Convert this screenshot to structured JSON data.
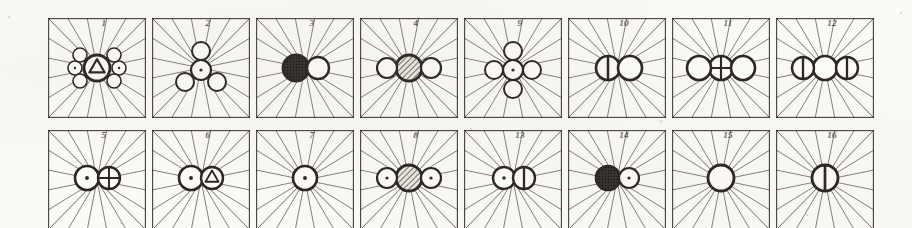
{
  "figure": {
    "kind": "crystallographic-plate",
    "background_color": "#fbfaf7",
    "ink_color": "#2a2724",
    "rows": 2,
    "columns": 8,
    "cell_width": 98,
    "cell_height": 100,
    "ray_count": 20,
    "caption": ""
  },
  "cells": [
    {
      "number": "1",
      "row": 0,
      "col": 0,
      "x": 48,
      "y": 18,
      "description": "central triangle-in-circle flanked by two dot-circles and four plain circles",
      "glyphs": [
        {
          "shape": "circle-triangle",
          "cx": 49,
          "cy": 50,
          "r": 13
        },
        {
          "shape": "circle-dot",
          "cx": 27,
          "cy": 50,
          "r": 7
        },
        {
          "shape": "circle-dot",
          "cx": 71,
          "cy": 50,
          "r": 7
        },
        {
          "shape": "circle-plain",
          "cx": 32,
          "cy": 37,
          "r": 7
        },
        {
          "shape": "circle-plain",
          "cx": 66,
          "cy": 37,
          "r": 7
        },
        {
          "shape": "circle-plain",
          "cx": 32,
          "cy": 63,
          "r": 7
        },
        {
          "shape": "circle-plain",
          "cx": 66,
          "cy": 63,
          "r": 7
        }
      ]
    },
    {
      "number": "2",
      "row": 0,
      "col": 1,
      "x": 152,
      "y": 18,
      "description": "central dot-circle with three plain circles in tripod arrangement",
      "glyphs": [
        {
          "shape": "circle-dot",
          "cx": 49,
          "cy": 52,
          "r": 10
        },
        {
          "shape": "circle-plain",
          "cx": 49,
          "cy": 33,
          "r": 9
        },
        {
          "shape": "circle-plain",
          "cx": 33,
          "cy": 64,
          "r": 9
        },
        {
          "shape": "circle-plain",
          "cx": 65,
          "cy": 64,
          "r": 9
        }
      ]
    },
    {
      "number": "3",
      "row": 0,
      "col": 2,
      "x": 256,
      "y": 18,
      "description": "dark hatched circle adjoining a plain white circle",
      "glyphs": [
        {
          "shape": "circle-dark",
          "cx": 40,
          "cy": 50,
          "r": 13
        },
        {
          "shape": "circle-plain",
          "cx": 62,
          "cy": 50,
          "r": 11
        }
      ]
    },
    {
      "number": "4",
      "row": 0,
      "col": 3,
      "x": 360,
      "y": 18,
      "description": "hatched circle between two plain white circles",
      "glyphs": [
        {
          "shape": "circle-hatch",
          "cx": 49,
          "cy": 50,
          "r": 13
        },
        {
          "shape": "circle-plain",
          "cx": 27,
          "cy": 50,
          "r": 10
        },
        {
          "shape": "circle-plain",
          "cx": 71,
          "cy": 50,
          "r": 10
        }
      ]
    },
    {
      "number": "9",
      "row": 0,
      "col": 4,
      "x": 464,
      "y": 18,
      "description": "central dot-circle with four plain circles at top, bottom, left and right",
      "glyphs": [
        {
          "shape": "circle-dot",
          "cx": 49,
          "cy": 52,
          "r": 10
        },
        {
          "shape": "circle-plain",
          "cx": 49,
          "cy": 33,
          "r": 9
        },
        {
          "shape": "circle-plain",
          "cx": 49,
          "cy": 71,
          "r": 9
        },
        {
          "shape": "circle-plain",
          "cx": 30,
          "cy": 52,
          "r": 9
        },
        {
          "shape": "circle-plain",
          "cx": 68,
          "cy": 52,
          "r": 9
        }
      ]
    },
    {
      "number": "10",
      "row": 0,
      "col": 5,
      "x": 568,
      "y": 18,
      "description": "half-filled circle adjoining a plain white circle",
      "glyphs": [
        {
          "shape": "circle-halfleft",
          "cx": 40,
          "cy": 50,
          "r": 12
        },
        {
          "shape": "circle-plain",
          "cx": 62,
          "cy": 50,
          "r": 12
        }
      ]
    },
    {
      "number": "11",
      "row": 0,
      "col": 6,
      "x": 672,
      "y": 18,
      "description": "cross-circle between two plain white circles",
      "glyphs": [
        {
          "shape": "circle-cross",
          "cx": 49,
          "cy": 50,
          "r": 12
        },
        {
          "shape": "circle-plain",
          "cx": 27,
          "cy": 50,
          "r": 12
        },
        {
          "shape": "circle-plain",
          "cx": 71,
          "cy": 50,
          "r": 12
        }
      ]
    },
    {
      "number": "12",
      "row": 0,
      "col": 7,
      "x": 776,
      "y": 18,
      "description": "plain white circle between two half-filled circles",
      "glyphs": [
        {
          "shape": "circle-plain",
          "cx": 49,
          "cy": 50,
          "r": 12
        },
        {
          "shape": "circle-halfleft",
          "cx": 27,
          "cy": 50,
          "r": 11
        },
        {
          "shape": "circle-halfleft",
          "cx": 71,
          "cy": 50,
          "r": 11
        }
      ]
    },
    {
      "number": "5",
      "row": 1,
      "col": 0,
      "x": 48,
      "y": 130,
      "description": "dot-circle adjoining a cross-circle",
      "glyphs": [
        {
          "shape": "circle-dot",
          "cx": 39,
          "cy": 48,
          "r": 12
        },
        {
          "shape": "circle-cross",
          "cx": 61,
          "cy": 48,
          "r": 11
        }
      ]
    },
    {
      "number": "6",
      "row": 1,
      "col": 1,
      "x": 152,
      "y": 130,
      "description": "dot-circle adjoining a circle containing a triangle",
      "glyphs": [
        {
          "shape": "circle-dot",
          "cx": 39,
          "cy": 48,
          "r": 12
        },
        {
          "shape": "circle-triangle",
          "cx": 60,
          "cy": 48,
          "r": 11
        }
      ]
    },
    {
      "number": "7",
      "row": 1,
      "col": 2,
      "x": 256,
      "y": 130,
      "description": "single dot-circle at centre",
      "glyphs": [
        {
          "shape": "circle-dot",
          "cx": 49,
          "cy": 48,
          "r": 12
        }
      ]
    },
    {
      "number": "8",
      "row": 1,
      "col": 3,
      "x": 360,
      "y": 130,
      "description": "hatched circle between two dot-circles",
      "glyphs": [
        {
          "shape": "circle-hatch",
          "cx": 49,
          "cy": 48,
          "r": 13
        },
        {
          "shape": "circle-dot",
          "cx": 27,
          "cy": 48,
          "r": 10
        },
        {
          "shape": "circle-dot",
          "cx": 71,
          "cy": 48,
          "r": 10
        }
      ]
    },
    {
      "number": "13",
      "row": 1,
      "col": 4,
      "x": 464,
      "y": 130,
      "description": "dot-circle adjoining a half-filled circle",
      "glyphs": [
        {
          "shape": "circle-dot",
          "cx": 40,
          "cy": 48,
          "r": 11
        },
        {
          "shape": "circle-halfleft",
          "cx": 60,
          "cy": 48,
          "r": 11
        }
      ]
    },
    {
      "number": "14",
      "row": 1,
      "col": 5,
      "x": 568,
      "y": 130,
      "description": "solid dark circle adjoining a dot-circle",
      "glyphs": [
        {
          "shape": "circle-dark",
          "cx": 40,
          "cy": 48,
          "r": 12
        },
        {
          "shape": "circle-dot",
          "cx": 61,
          "cy": 48,
          "r": 10
        }
      ]
    },
    {
      "number": "15",
      "row": 1,
      "col": 6,
      "x": 672,
      "y": 130,
      "description": "single plain white circle at centre",
      "glyphs": [
        {
          "shape": "circle-plain",
          "cx": 49,
          "cy": 48,
          "r": 13
        }
      ]
    },
    {
      "number": "16",
      "row": 1,
      "col": 7,
      "x": 776,
      "y": 130,
      "description": "single circle bisected by a vertical line",
      "glyphs": [
        {
          "shape": "circle-halfleft",
          "cx": 49,
          "cy": 48,
          "r": 13
        }
      ]
    }
  ]
}
